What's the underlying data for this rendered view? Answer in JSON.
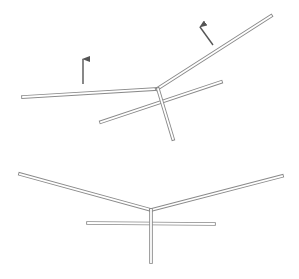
{
  "diagram": {
    "colors": {
      "background": "#ffffff",
      "bar_outline": "#8a8a8a",
      "bar_fill": "#ffffff",
      "arrow": "#555555"
    },
    "top_figure": {
      "bars": [
        {
          "name": "left-wing",
          "x1": 23,
          "y1": 97,
          "x2": 157,
          "y2": 89
        },
        {
          "name": "right-wing",
          "x1": 157,
          "y1": 89,
          "x2": 271,
          "y2": 16
        },
        {
          "name": "crossbar",
          "x1": 101,
          "y1": 122,
          "x2": 221,
          "y2": 82
        },
        {
          "name": "stem",
          "x1": 158,
          "y1": 89,
          "x2": 173,
          "y2": 139
        }
      ],
      "arrows": [
        {
          "name": "left-arrow",
          "x1": 83,
          "y1": 84,
          "x2": 83,
          "y2": 59
        },
        {
          "name": "right-arrow",
          "x1": 213,
          "y1": 45,
          "x2": 200,
          "y2": 27
        }
      ]
    },
    "bottom_figure": {
      "bars": [
        {
          "name": "left-wing",
          "x1": 20,
          "y1": 174,
          "x2": 151,
          "y2": 210
        },
        {
          "name": "right-wing",
          "x1": 151,
          "y1": 210,
          "x2": 282,
          "y2": 176
        },
        {
          "name": "crossbar",
          "x1": 88,
          "y1": 223,
          "x2": 214,
          "y2": 224
        },
        {
          "name": "stem",
          "x1": 151,
          "y1": 210,
          "x2": 151,
          "y2": 262
        }
      ]
    }
  }
}
